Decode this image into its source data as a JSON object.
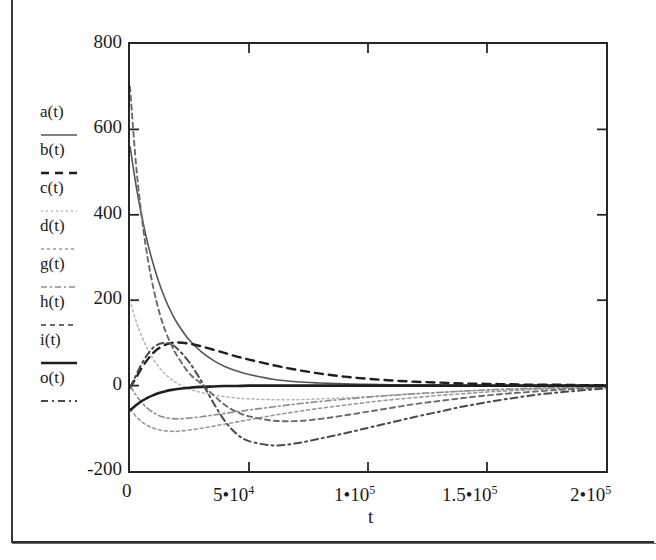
{
  "figure": {
    "type": "line-plot",
    "background": "#ffffff",
    "frame_color": "#262626"
  },
  "axes": {
    "x_title": "t",
    "y_title": "",
    "y_ticks": [
      "800",
      "600",
      "400",
      "200",
      "0",
      "-200"
    ],
    "y_tick_values": [
      800,
      600,
      400,
      200,
      0,
      -200
    ],
    "x_ticks": [
      {
        "text": "0",
        "base": "0",
        "mult": "",
        "exp": ""
      },
      {
        "text": "5*10^4",
        "base": "5",
        "mult": "•",
        "exp": "4"
      },
      {
        "text": "1*10^5",
        "base": "1",
        "mult": "•",
        "exp": "5"
      },
      {
        "text": "1.5*10^5",
        "base": "1.5",
        "mult": "•",
        "exp": "5"
      },
      {
        "text": "2*10^5",
        "base": "2",
        "mult": "•",
        "exp": "5"
      }
    ],
    "x_tick_values": [
      0,
      50000,
      100000,
      150000,
      200000
    ]
  },
  "legend": {
    "entries": [
      {
        "label": "a",
        "arg": "(t)",
        "dash": "none",
        "color": "#555555",
        "width": 1.6
      },
      {
        "label": "b",
        "arg": "(t)",
        "dash": "8 6",
        "color": "#1f1f1f",
        "width": 2.4
      },
      {
        "label": "c",
        "arg": "(t)",
        "dash": "2 3",
        "color": "#b4b4b4",
        "width": 1.5
      },
      {
        "label": "d",
        "arg": "(t)",
        "dash": "3 3",
        "color": "#9a9a9a",
        "width": 1.6
      },
      {
        "label": "g",
        "arg": "(t)",
        "dash": "6 3 2 3",
        "color": "#8d8d8d",
        "width": 1.6
      },
      {
        "label": "h",
        "arg": "(t)",
        "dash": "5 4",
        "color": "#6a6a6a",
        "width": 1.9
      },
      {
        "label": "i",
        "arg": "(t)",
        "dash": "none",
        "color": "#1f1f1f",
        "width": 2.6
      },
      {
        "label": "o",
        "arg": "(t)",
        "dash": "7 4 2 4",
        "color": "#4a4a4a",
        "width": 2.0
      }
    ]
  },
  "chart_data": {
    "type": "line",
    "title": "",
    "xlabel": "t",
    "ylabel": "",
    "xlim": [
      0,
      200000
    ],
    "ylim": [
      -200,
      800
    ],
    "grid": false,
    "legend_position": "left-outside",
    "x": [
      0,
      2500,
      5000,
      7500,
      10000,
      12500,
      15000,
      17500,
      20000,
      25000,
      30000,
      35000,
      40000,
      45000,
      50000,
      60000,
      70000,
      80000,
      90000,
      100000,
      110000,
      120000,
      130000,
      140000,
      150000,
      160000,
      170000,
      180000,
      190000,
      200000
    ],
    "series": [
      {
        "name": "a(t)",
        "dash": "none",
        "color": "#555555",
        "width": 1.6,
        "values": [
          560,
          470,
          395,
          332,
          280,
          236,
          200,
          170,
          145,
          106,
          79,
          59,
          44,
          34,
          26,
          15,
          9,
          6,
          4,
          3,
          2,
          1,
          1,
          0,
          0,
          0,
          0,
          0,
          0,
          0
        ]
      },
      {
        "name": "b(t)",
        "dash": "8 6",
        "color": "#1f1f1f",
        "width": 2.4,
        "values": [
          -5,
          18,
          42,
          62,
          78,
          89,
          96,
          100,
          101,
          98,
          92,
          84,
          76,
          68,
          61,
          48,
          37,
          28,
          21,
          16,
          12,
          9,
          7,
          5,
          4,
          3,
          2,
          2,
          1,
          1
        ]
      },
      {
        "name": "c(t)",
        "dash": "2 3",
        "color": "#b4b4b4",
        "width": 1.5,
        "values": [
          200,
          152,
          114,
          84,
          60,
          41,
          26,
          14,
          5,
          -8,
          -16,
          -22,
          -26,
          -29,
          -31,
          -33,
          -33,
          -31,
          -29,
          -26,
          -22,
          -19,
          -16,
          -13,
          -11,
          -9,
          -7,
          -5,
          -4,
          -3
        ]
      },
      {
        "name": "d(t)",
        "dash": "3 3",
        "color": "#9a9a9a",
        "width": 1.6,
        "values": [
          -55,
          -72,
          -85,
          -94,
          -100,
          -104,
          -106,
          -107,
          -107,
          -104,
          -100,
          -95,
          -90,
          -85,
          -80,
          -70,
          -61,
          -53,
          -46,
          -39,
          -33,
          -28,
          -23,
          -19,
          -15,
          -12,
          -9,
          -7,
          -5,
          -3
        ]
      },
      {
        "name": "g(t)",
        "dash": "6 3 2 3",
        "color": "#8d8d8d",
        "width": 1.6,
        "values": [
          0,
          -22,
          -40,
          -54,
          -64,
          -71,
          -75,
          -77,
          -78,
          -76,
          -73,
          -69,
          -65,
          -61,
          -57,
          -50,
          -43,
          -37,
          -32,
          -27,
          -23,
          -19,
          -16,
          -13,
          -10,
          -8,
          -6,
          -5,
          -3,
          -2
        ]
      },
      {
        "name": "h(t)",
        "dash": "5 4",
        "color": "#6a6a6a",
        "width": 1.9,
        "values": [
          700,
          520,
          392,
          296,
          224,
          168,
          126,
          94,
          68,
          28,
          4,
          -22,
          -46,
          -62,
          -72,
          -82,
          -83,
          -78,
          -70,
          -61,
          -52,
          -43,
          -36,
          -29,
          -23,
          -18,
          -14,
          -10,
          -7,
          -5
        ]
      },
      {
        "name": "i(t)",
        "dash": "none",
        "color": "#1f1f1f",
        "width": 2.6,
        "values": [
          -58,
          -46,
          -36,
          -28,
          -22,
          -17,
          -13,
          -10,
          -8,
          -5,
          -3,
          -2,
          -1,
          -1,
          0,
          0,
          0,
          0,
          0,
          0,
          0,
          0,
          0,
          0,
          0,
          0,
          0,
          0,
          0,
          0
        ]
      },
      {
        "name": "o(t)",
        "dash": "7 4 2 4",
        "color": "#4a4a4a",
        "width": 2.0,
        "values": [
          -5,
          24,
          52,
          74,
          90,
          98,
          100,
          96,
          86,
          54,
          10,
          -40,
          -84,
          -114,
          -130,
          -140,
          -135,
          -124,
          -112,
          -99,
          -86,
          -73,
          -61,
          -49,
          -39,
          -30,
          -22,
          -16,
          -11,
          -7
        ]
      }
    ]
  }
}
